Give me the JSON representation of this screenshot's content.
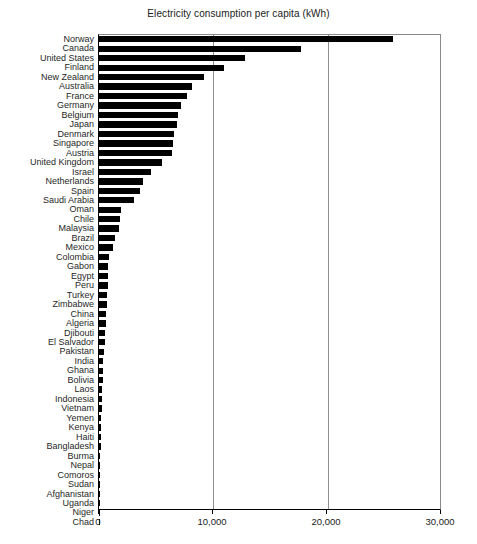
{
  "chart_data": {
    "type": "bar",
    "orientation": "horizontal",
    "title": "Electricity consumption per capita (kWh)",
    "xlabel": "",
    "ylabel": "",
    "xlim": [
      0,
      30000
    ],
    "ylim": null,
    "grid": true,
    "grid_axis": "x",
    "legend": null,
    "bar_color": "#000000",
    "xticks": [
      0,
      10000,
      20000,
      30000
    ],
    "xtick_labels": [
      "0",
      "10,000",
      "20,000",
      "30,000"
    ],
    "categories": [
      "Norway",
      "Canada",
      "United States",
      "Finland",
      "New Zealand",
      "Australia",
      "France",
      "Germany",
      "Belgium",
      "Japan",
      "Denmark",
      "Singapore",
      "Austria",
      "United Kingdom",
      "Israel",
      "Netherlands",
      "Spain",
      "Saudi Arabia",
      "Oman",
      "Chile",
      "Malaysia",
      "Brazil",
      "Mexico",
      "Colombia",
      "Gabon",
      "Egypt",
      "Peru",
      "Turkey",
      "Zimbabwe",
      "China",
      "Algeria",
      "Djibouti",
      "El Salvador",
      "Pakistan",
      "India",
      "Ghana",
      "Bolivia",
      "Laos",
      "Indonesia",
      "Vietnam",
      "Yemen",
      "Kenya",
      "Haiti",
      "Bangladesh",
      "Burma",
      "Nepal",
      "Comoros",
      "Sudan",
      "Afghanistan",
      "Uganda",
      "Niger",
      "Chad"
    ],
    "values": [
      25800,
      17700,
      12800,
      11000,
      9200,
      8200,
      7700,
      7200,
      6900,
      6800,
      6600,
      6500,
      6400,
      5500,
      4600,
      3900,
      3600,
      3100,
      1900,
      1800,
      1750,
      1400,
      1250,
      850,
      800,
      780,
      750,
      720,
      700,
      650,
      620,
      540,
      520,
      420,
      390,
      360,
      350,
      300,
      280,
      230,
      210,
      180,
      160,
      140,
      120,
      100,
      90,
      80,
      60,
      50,
      40,
      30
    ]
  }
}
